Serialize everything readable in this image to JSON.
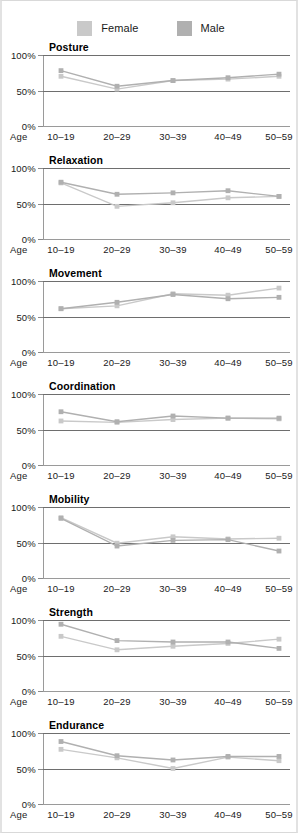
{
  "legend": {
    "items": [
      {
        "label": "Female",
        "color": "#c9c9c9",
        "icon": "legend-swatch-icon"
      },
      {
        "label": "Male",
        "color": "#b0b0b0",
        "icon": "legend-swatch-icon"
      }
    ]
  },
  "axis": {
    "x_name": "Age",
    "y_ticks": [
      "100%",
      "50%",
      "0%"
    ],
    "categories": [
      "10–19",
      "20–29",
      "30–39",
      "40–49",
      "50–59"
    ]
  },
  "chart_data": [
    {
      "type": "line",
      "title": "Posture",
      "xlabel": "Age",
      "ylabel": "",
      "ylim": [
        0,
        100
      ],
      "grid": true,
      "legend_position": "top-center",
      "categories": [
        "10–19",
        "20–29",
        "30–39",
        "40–49",
        "50–59"
      ],
      "series": [
        {
          "name": "Female",
          "color": "#c9c9c9",
          "values": [
            70,
            52,
            64,
            66,
            70
          ]
        },
        {
          "name": "Male",
          "color": "#b0b0b0",
          "values": [
            78,
            56,
            64,
            68,
            73
          ]
        }
      ]
    },
    {
      "type": "line",
      "title": "Relaxation",
      "xlabel": "Age",
      "ylabel": "",
      "ylim": [
        0,
        100
      ],
      "grid": true,
      "legend_position": "top-center",
      "categories": [
        "10–19",
        "20–29",
        "30–39",
        "40–49",
        "50–59"
      ],
      "series": [
        {
          "name": "Female",
          "color": "#c9c9c9",
          "values": [
            79,
            46,
            51,
            58,
            60
          ]
        },
        {
          "name": "Male",
          "color": "#b0b0b0",
          "values": [
            80,
            63,
            65,
            68,
            60
          ]
        }
      ]
    },
    {
      "type": "line",
      "title": "Movement",
      "xlabel": "Age",
      "ylabel": "",
      "ylim": [
        0,
        100
      ],
      "grid": true,
      "legend_position": "top-center",
      "categories": [
        "10–19",
        "20–29",
        "30–39",
        "40–49",
        "50–59"
      ],
      "series": [
        {
          "name": "Female",
          "color": "#c9c9c9",
          "values": [
            61,
            65,
            82,
            80,
            90
          ]
        },
        {
          "name": "Male",
          "color": "#b0b0b0",
          "values": [
            61,
            70,
            81,
            75,
            77
          ]
        }
      ]
    },
    {
      "type": "line",
      "title": "Coordination",
      "xlabel": "Age",
      "ylabel": "",
      "ylim": [
        0,
        100
      ],
      "grid": true,
      "legend_position": "top-center",
      "categories": [
        "10–19",
        "20–29",
        "30–39",
        "40–49",
        "50–59"
      ],
      "series": [
        {
          "name": "Female",
          "color": "#c9c9c9",
          "values": [
            62,
            60,
            64,
            66,
            65
          ]
        },
        {
          "name": "Male",
          "color": "#b0b0b0",
          "values": [
            75,
            61,
            69,
            66,
            66
          ]
        }
      ]
    },
    {
      "type": "line",
      "title": "Mobility",
      "xlabel": "Age",
      "ylabel": "",
      "ylim": [
        0,
        100
      ],
      "grid": true,
      "legend_position": "top-center",
      "categories": [
        "10–19",
        "20–29",
        "30–39",
        "40–49",
        "50–59"
      ],
      "series": [
        {
          "name": "Female",
          "color": "#c9c9c9",
          "values": [
            85,
            49,
            58,
            55,
            56
          ]
        },
        {
          "name": "Male",
          "color": "#b0b0b0",
          "values": [
            84,
            45,
            53,
            54,
            38
          ]
        }
      ]
    },
    {
      "type": "line",
      "title": "Strength",
      "xlabel": "Age",
      "ylabel": "",
      "ylim": [
        0,
        100
      ],
      "grid": true,
      "legend_position": "top-center",
      "categories": [
        "10–19",
        "20–29",
        "30–39",
        "40–49",
        "50–59"
      ],
      "series": [
        {
          "name": "Female",
          "color": "#c9c9c9",
          "values": [
            77,
            58,
            63,
            67,
            73
          ]
        },
        {
          "name": "Male",
          "color": "#b0b0b0",
          "values": [
            94,
            71,
            69,
            69,
            60
          ]
        }
      ]
    },
    {
      "type": "line",
      "title": "Endurance",
      "xlabel": "Age",
      "ylabel": "",
      "ylim": [
        0,
        100
      ],
      "grid": true,
      "legend_position": "top-center",
      "categories": [
        "10–19",
        "20–29",
        "30–39",
        "40–49",
        "50–59"
      ],
      "series": [
        {
          "name": "Female",
          "color": "#c9c9c9",
          "values": [
            77,
            65,
            50,
            66,
            61
          ]
        },
        {
          "name": "Male",
          "color": "#b0b0b0",
          "values": [
            88,
            68,
            62,
            67,
            67
          ]
        }
      ]
    }
  ]
}
